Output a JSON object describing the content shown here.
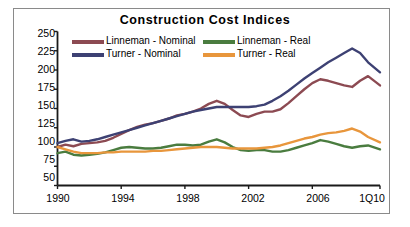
{
  "chart_data": {
    "type": "line",
    "title": "Construction Cost Indices",
    "xlabel": "",
    "ylabel": "",
    "ylim": [
      50,
      250
    ],
    "yticks": [
      50,
      75,
      100,
      125,
      150,
      175,
      200,
      225,
      250
    ],
    "xticks": [
      "1990",
      "1994",
      "1998",
      "2002",
      "2006",
      "1Q10"
    ],
    "xtick_values": [
      1990,
      1994,
      1998,
      2002,
      2006,
      2010.25
    ],
    "xlim": [
      1990,
      2010.25
    ],
    "grid": false,
    "legend_position": "top-inside",
    "series": [
      {
        "name": "Linneman - Nominal",
        "color": "#8c4a52",
        "x": [
          1990,
          1990.5,
          1991,
          1991.5,
          1992,
          1992.5,
          1993,
          1993.5,
          1994,
          1994.5,
          1995,
          1995.5,
          1996,
          1996.5,
          1997,
          1997.5,
          1998,
          1998.5,
          1999,
          1999.5,
          2000,
          2000.5,
          2001,
          2001.5,
          2002,
          2002.5,
          2003,
          2003.5,
          2004,
          2004.5,
          2005,
          2005.5,
          2006,
          2006.5,
          2007,
          2007.5,
          2008,
          2008.5,
          2009,
          2009.5,
          2010.25
        ],
        "values": [
          100,
          103,
          101,
          104,
          105,
          106,
          108,
          112,
          117,
          122,
          126,
          129,
          131,
          134,
          137,
          141,
          143,
          146,
          150,
          156,
          160,
          156,
          148,
          141,
          139,
          143,
          146,
          146,
          149,
          157,
          166,
          175,
          183,
          188,
          186,
          183,
          180,
          178,
          186,
          192,
          180
        ],
        "final_value": 180
      },
      {
        "name": "Turner - Nominal",
        "color": "#3d4173",
        "x": [
          1990,
          1990.5,
          1991,
          1991.5,
          1992,
          1992.5,
          1993,
          1993.5,
          1994,
          1994.5,
          1995,
          1995.5,
          1996,
          1996.5,
          1997,
          1997.5,
          1998,
          1998.5,
          1999,
          1999.5,
          2000,
          2000.5,
          2001,
          2001.5,
          2002,
          2002.5,
          2003,
          2003.5,
          2004,
          2004.5,
          2005,
          2005.5,
          2006,
          2006.5,
          2007,
          2007.5,
          2008,
          2008.5,
          2009,
          2009.5,
          2010.25
        ],
        "values": [
          105,
          108,
          110,
          107,
          108,
          110,
          113,
          116,
          119,
          122,
          125,
          128,
          131,
          134,
          137,
          140,
          143,
          146,
          148,
          150,
          152,
          152,
          152,
          152,
          152,
          153,
          155,
          160,
          166,
          173,
          181,
          189,
          196,
          203,
          210,
          216,
          222,
          228,
          222,
          210,
          197
        ],
        "final_value": 197
      },
      {
        "name": "Linneman - Real",
        "color": "#4a7c3f",
        "x": [
          1990,
          1990.5,
          1991,
          1991.5,
          1992,
          1992.5,
          1993,
          1993.5,
          1994,
          1994.5,
          1995,
          1995.5,
          1996,
          1996.5,
          1997,
          1997.5,
          1998,
          1998.5,
          1999,
          1999.5,
          2000,
          2000.5,
          2001,
          2001.5,
          2002,
          2002.5,
          2003,
          2003.5,
          2004,
          2004.5,
          2005,
          2005.5,
          2006,
          2006.5,
          2007,
          2007.5,
          2008,
          2008.5,
          2009,
          2009.5,
          2010.25
        ],
        "values": [
          92,
          94,
          90,
          89,
          90,
          91,
          93,
          96,
          99,
          100,
          99,
          98,
          98,
          99,
          101,
          103,
          103,
          102,
          103,
          107,
          110,
          106,
          100,
          96,
          95,
          96,
          96,
          94,
          94,
          96,
          99,
          102,
          105,
          109,
          107,
          104,
          101,
          99,
          101,
          102,
          97
        ],
        "final_value": 97
      },
      {
        "name": "Turner - Real",
        "color": "#e8963c",
        "x": [
          1990,
          1990.5,
          1991,
          1991.5,
          1992,
          1992.5,
          1993,
          1993.5,
          1994,
          1994.5,
          1995,
          1995.5,
          1996,
          1996.5,
          1997,
          1997.5,
          1998,
          1998.5,
          1999,
          1999.5,
          2000,
          2000.5,
          2001,
          2001.5,
          2002,
          2002.5,
          2003,
          2003.5,
          2004,
          2004.5,
          2005,
          2005.5,
          2006,
          2006.5,
          2007,
          2007.5,
          2008,
          2008.5,
          2009,
          2009.5,
          2010.25
        ],
        "values": [
          100,
          97,
          94,
          92,
          92,
          92,
          93,
          93,
          94,
          94,
          94,
          94,
          95,
          95,
          96,
          97,
          98,
          99,
          100,
          100,
          100,
          99,
          98,
          98,
          98,
          98,
          99,
          100,
          102,
          105,
          108,
          111,
          113,
          116,
          118,
          119,
          121,
          124,
          120,
          113,
          106
        ],
        "final_value": 106
      }
    ]
  },
  "legend": {
    "items": [
      {
        "label": "Linneman - Nominal",
        "color": "#8c4a52"
      },
      {
        "label": "Turner - Nominal",
        "color": "#3d4173"
      },
      {
        "label": "Linneman - Real",
        "color": "#4a7c3f"
      },
      {
        "label": "Turner - Real",
        "color": "#e8963c"
      }
    ]
  },
  "axis": {
    "y_labels": [
      "250",
      "225",
      "200",
      "175",
      "150",
      "125",
      "100",
      "75",
      "50"
    ],
    "x_labels": [
      "1990",
      "1994",
      "1998",
      "2002",
      "2006",
      "1Q10"
    ]
  }
}
